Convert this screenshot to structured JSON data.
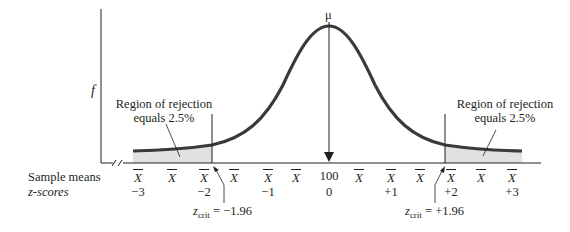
{
  "figure": {
    "type": "normal-distribution-diagram",
    "y_axis_label": "f",
    "mean_label": "μ",
    "row_labels": {
      "sample_means": "Sample means",
      "z_scores": "z-scores"
    },
    "x_ticks": [
      {
        "x": 138,
        "mean_label": "X",
        "z": "−3"
      },
      {
        "x": 172,
        "mean_label": "X",
        "z": ""
      },
      {
        "x": 204,
        "mean_label": "X",
        "z": "−2"
      },
      {
        "x": 234,
        "mean_label": "X",
        "z": ""
      },
      {
        "x": 268,
        "mean_label": "X",
        "z": "−1"
      },
      {
        "x": 296,
        "mean_label": "X",
        "z": ""
      },
      {
        "x": 329,
        "mean_label": "100",
        "z": "0"
      },
      {
        "x": 359,
        "mean_label": "X",
        "z": ""
      },
      {
        "x": 391,
        "mean_label": "X",
        "z": "+1"
      },
      {
        "x": 420,
        "mean_label": "X",
        "z": ""
      },
      {
        "x": 451,
        "mean_label": "X",
        "z": "+2"
      },
      {
        "x": 481,
        "mean_label": "X",
        "z": ""
      },
      {
        "x": 512,
        "mean_label": "X",
        "z": "+3"
      }
    ],
    "left_region": {
      "line1": "Region of rejection",
      "line2": "equals 2.5%"
    },
    "right_region": {
      "line1": "Region of rejection",
      "line2": "equals 2.5%"
    },
    "left_critical": {
      "z_symbol": "z",
      "subscript": "crit",
      "value_text": " = −1.96"
    },
    "right_critical": {
      "z_symbol": "z",
      "subscript": "crit",
      "value_text": " = +1.96"
    },
    "colors": {
      "curve": "#3a3a3a",
      "shade": "#e1e2e3",
      "axis": "#231f20"
    }
  }
}
